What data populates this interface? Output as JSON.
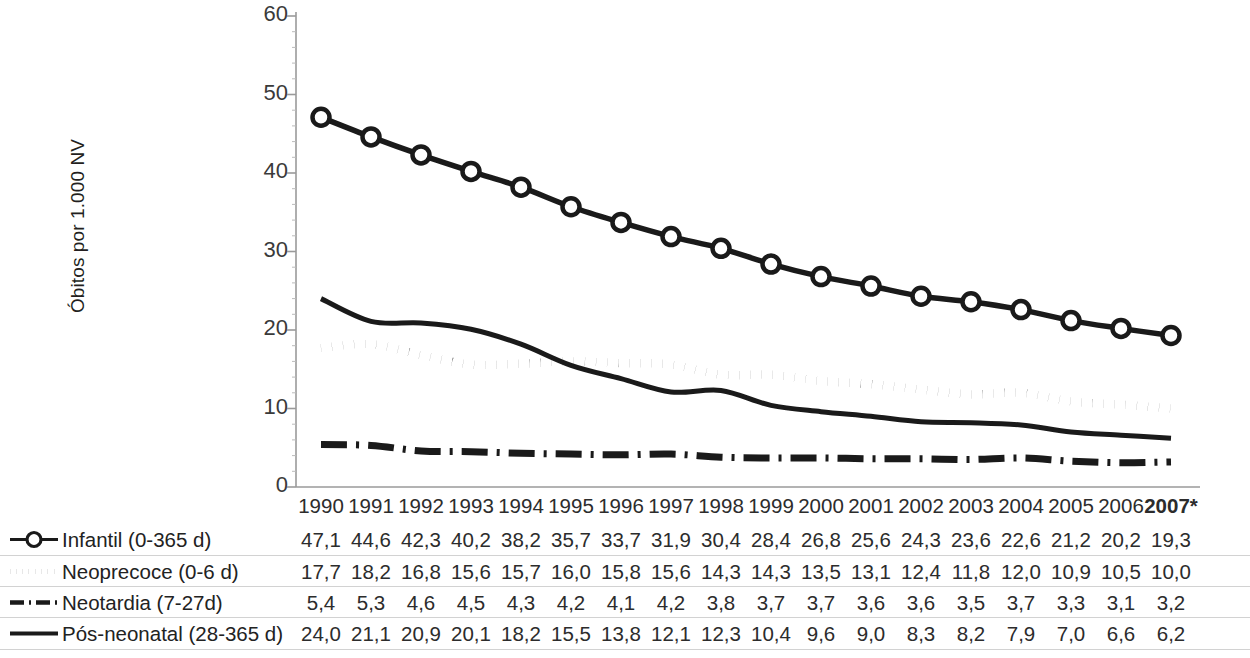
{
  "chart_data": {
    "type": "line",
    "title": "",
    "xlabel": "",
    "ylabel": "Óbitos por 1.000 NV",
    "ylim": [
      0,
      60
    ],
    "yticks": [
      0,
      10,
      20,
      30,
      40,
      50,
      60
    ],
    "ytick_labels": [
      "0",
      "10",
      "20",
      "30",
      "40",
      "50",
      "60"
    ],
    "grid": false,
    "legend_position": "bottom-table",
    "categories": [
      "1990",
      "1991",
      "1992",
      "1993",
      "1994",
      "1995",
      "1996",
      "1997",
      "1998",
      "1999",
      "2000",
      "2001",
      "2002",
      "2003",
      "2004",
      "2005",
      "2006",
      "2007*"
    ],
    "series": [
      {
        "name": "Infantil (0-365 d)",
        "style": "solid-marker",
        "marker": "open-circle",
        "values": [
          47.1,
          44.6,
          42.3,
          40.2,
          38.2,
          35.7,
          33.7,
          31.9,
          30.4,
          28.4,
          26.8,
          25.6,
          24.3,
          23.6,
          22.6,
          21.2,
          20.2,
          19.3
        ],
        "labels": [
          "47,1",
          "44,6",
          "42,3",
          "40,2",
          "38,2",
          "35,7",
          "33,7",
          "31,9",
          "30,4",
          "28,4",
          "26,8",
          "25,6",
          "24,3",
          "23,6",
          "22,6",
          "21,2",
          "20,2",
          "19,3"
        ]
      },
      {
        "name": "Neoprecoce (0-6 d)",
        "style": "dotted",
        "marker": "none",
        "values": [
          17.7,
          18.2,
          16.8,
          15.6,
          15.7,
          16.0,
          15.8,
          15.6,
          14.3,
          14.3,
          13.5,
          13.1,
          12.4,
          11.8,
          12.0,
          10.9,
          10.5,
          10.0
        ],
        "labels": [
          "17,7",
          "18,2",
          "16,8",
          "15,6",
          "15,7",
          "16,0",
          "15,8",
          "15,6",
          "14,3",
          "14,3",
          "13,5",
          "13,1",
          "12,4",
          "11,8",
          "12,0",
          "10,9",
          "10,5",
          "10,0"
        ]
      },
      {
        "name": "Neotardia (7-27d)",
        "style": "dash-dot",
        "marker": "none",
        "values": [
          5.4,
          5.3,
          4.6,
          4.5,
          4.3,
          4.2,
          4.1,
          4.2,
          3.8,
          3.7,
          3.7,
          3.6,
          3.6,
          3.5,
          3.7,
          3.3,
          3.1,
          3.2
        ],
        "labels": [
          "5,4",
          "5,3",
          "4,6",
          "4,5",
          "4,3",
          "4,2",
          "4,1",
          "4,2",
          "3,8",
          "3,7",
          "3,7",
          "3,6",
          "3,6",
          "3,5",
          "3,7",
          "3,3",
          "3,1",
          "3,2"
        ]
      },
      {
        "name": "Pós-neonatal (28-365 d)",
        "style": "solid",
        "marker": "none",
        "values": [
          24.0,
          21.1,
          20.9,
          20.1,
          18.2,
          15.5,
          13.8,
          12.1,
          12.3,
          10.4,
          9.6,
          9.0,
          8.3,
          8.2,
          7.9,
          7.0,
          6.6,
          6.2
        ],
        "labels": [
          "24,0",
          "21,1",
          "20,9",
          "20,1",
          "18,2",
          "15,5",
          "13,8",
          "12,1",
          "12,3",
          "10,4",
          "9,6",
          "9,0",
          "8,3",
          "8,2",
          "7,9",
          "7,0",
          "6,6",
          "6,2"
        ]
      }
    ],
    "colors": {
      "line": "#1a1a1a",
      "axis": "#9a9a9a",
      "text": "#2c2c2c",
      "separator": "#d2d2d2"
    }
  }
}
